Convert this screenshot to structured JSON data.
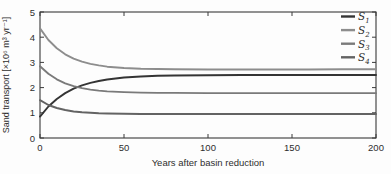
{
  "figure": {
    "kind": "scientific-line-plot"
  },
  "chart_data": {
    "type": "line",
    "title": "",
    "xlabel": "Years after basin reduction",
    "ylabel": "Sand transport [×10⁶ m³ yr⁻¹]",
    "xlim": [
      0,
      200
    ],
    "ylim": [
      0,
      5
    ],
    "xticks": [
      0,
      50,
      100,
      150,
      200
    ],
    "yticks": [
      0,
      1,
      2,
      3,
      4,
      5
    ],
    "grid": false,
    "legend_position": "top-right",
    "frame_color": "#3a3a3a",
    "x": [
      0,
      5,
      10,
      15,
      20,
      25,
      30,
      35,
      40,
      50,
      60,
      70,
      80,
      100,
      120,
      140,
      160,
      180,
      200
    ],
    "series": [
      {
        "name": "S1",
        "label": "S",
        "sub": "1",
        "color": "#343434",
        "values": [
          0.85,
          1.25,
          1.55,
          1.78,
          1.96,
          2.09,
          2.19,
          2.26,
          2.32,
          2.4,
          2.44,
          2.47,
          2.48,
          2.49,
          2.5,
          2.5,
          2.5,
          2.5,
          2.5
        ]
      },
      {
        "name": "S2",
        "label": "S",
        "sub": "2",
        "color": "#8d8d8d",
        "values": [
          4.35,
          3.89,
          3.56,
          3.32,
          3.15,
          3.03,
          2.94,
          2.88,
          2.83,
          2.78,
          2.75,
          2.74,
          2.73,
          2.72,
          2.72,
          2.72,
          2.72,
          2.73,
          2.73
        ]
      },
      {
        "name": "S3",
        "label": "S",
        "sub": "3",
        "color": "#7a7a7a",
        "values": [
          2.85,
          2.55,
          2.33,
          2.17,
          2.06,
          1.98,
          1.92,
          1.88,
          1.85,
          1.82,
          1.8,
          1.79,
          1.79,
          1.78,
          1.78,
          1.78,
          1.78,
          1.78,
          1.78
        ]
      },
      {
        "name": "S4",
        "label": "S",
        "sub": "4",
        "color": "#636363",
        "values": [
          1.5,
          1.31,
          1.19,
          1.11,
          1.05,
          1.02,
          1.0,
          0.98,
          0.97,
          0.96,
          0.95,
          0.95,
          0.95,
          0.95,
          0.95,
          0.95,
          0.95,
          0.95,
          0.95
        ]
      }
    ]
  }
}
